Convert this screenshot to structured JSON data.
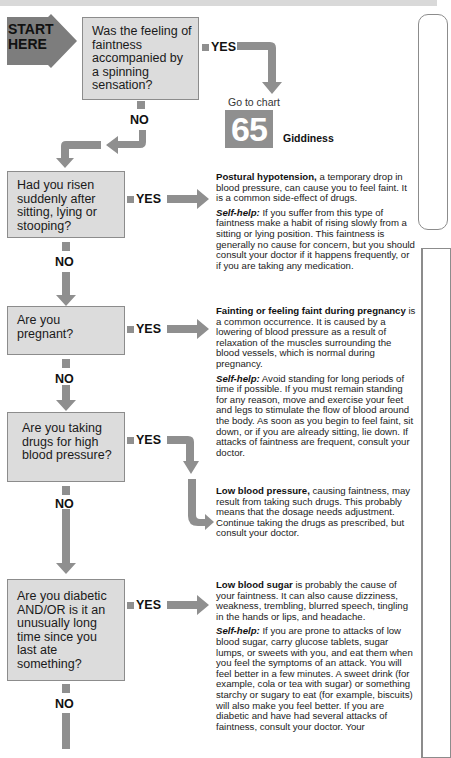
{
  "start": {
    "line1": "START",
    "line2": "HERE"
  },
  "questions": [
    {
      "id": "q1",
      "text": "Was the feeling of faintness accompanied by a spinning sensation?"
    },
    {
      "id": "q2",
      "text": "Had you risen suddenly after sitting, lying or stooping?"
    },
    {
      "id": "q3",
      "text": "Are you pregnant?"
    },
    {
      "id": "q4",
      "text": "Are you taking drugs for high blood pressure?"
    },
    {
      "id": "q5",
      "text": "Are you diabetic AND/OR is it an unusually long time since you last ate something?"
    }
  ],
  "labels": {
    "yes": "YES",
    "no": "NO"
  },
  "goto": {
    "prefix": "Go to chart",
    "number": "65",
    "title": "Giddiness"
  },
  "answers": {
    "postural": {
      "bold": "Postural hypotension,",
      "text": " a temporary drop in blood pressure, can cause you to feel faint. It is a common side-effect of drugs.",
      "selfhelp_label": "Self-help:",
      "selfhelp": " If you suffer from this type of faintness make a habit of rising slowly from a sitting or lying position. This faintness is generally no cause for concern, but you should consult your doctor if it happens frequently, or if you are taking any medication."
    },
    "pregnancy": {
      "bold": "Fainting or feeling faint during pregnancy",
      "text": " is a common occurrence. It is caused by a lowering of blood pressure as a result of relaxation of the muscles surrounding the blood vessels, which is normal during pregnancy.",
      "selfhelp_label": "Self-help:",
      "selfhelp": " Avoid standing for long periods of time if possible. If you must remain standing for any reason, move and exercise your feet and legs to stimulate the flow of blood around the body. As soon as you begin to feel faint, sit down, or if you are already sitting, lie down. If attacks of faintness are frequent, consult your doctor."
    },
    "lowbp": {
      "bold": "Low blood pressure,",
      "text": " causing faintness, may result from taking such drugs. This probably means that the dosage needs adjustment. Continue taking the drugs as prescribed, but consult your doctor."
    },
    "lowsugar": {
      "bold": "Low blood sugar",
      "text": " is probably the cause of your faintness. It can also cause dizziness, weakness, trembling, blurred speech, tingling in the hands or lips, and headache.",
      "selfhelp_label": "Self-help:",
      "selfhelp": " If you are prone to attacks of low blood sugar, carry glucose tablets, sugar lumps, or sweets with you, and eat them when you feel the symptoms of an attack. You will feel better in a few minutes. A sweet drink (for example, cola or tea with sugar) or something starchy or sugary to eat (for example, biscuits) will also make you feel better. If you are diabetic and have had several attacks of faintness, consult your doctor. Your"
    }
  },
  "colors": {
    "arrow": "#8f8f8f",
    "box": "#dcdcdc",
    "box_border": "#8c8c8c",
    "start": "#7d7d7d"
  }
}
